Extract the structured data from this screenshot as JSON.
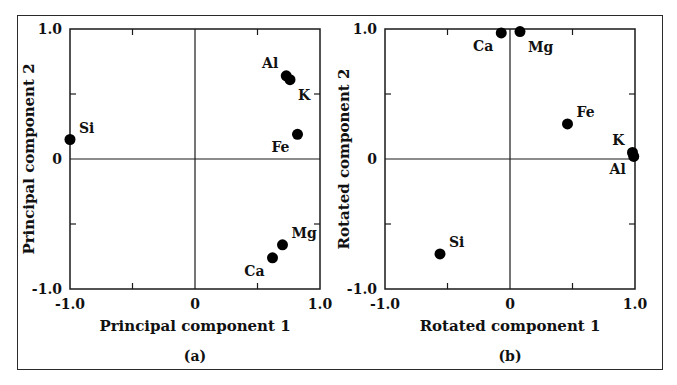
{
  "chart_data": [
    {
      "id": "a",
      "type": "scatter",
      "caption": "(a)",
      "title": "",
      "xlabel": "Principal component 1",
      "ylabel": "Principal component 2",
      "xlim": [
        -1.0,
        1.0
      ],
      "ylim": [
        -1.0,
        1.0
      ],
      "x_tick_labels": [
        "-1.0",
        "0",
        "1.0"
      ],
      "y_tick_labels": [
        "-1.0",
        "0",
        "1.0"
      ],
      "minor_ticks": [
        -0.5,
        0.5
      ],
      "grid": false,
      "zero_lines": true,
      "legend": null,
      "points": [
        {
          "label": "Al",
          "x": 0.73,
          "y": 0.64,
          "label_pos": "upper-left"
        },
        {
          "label": "K",
          "x": 0.76,
          "y": 0.61,
          "label_pos": "lower-right"
        },
        {
          "label": "Fe",
          "x": 0.82,
          "y": 0.19,
          "label_pos": "lower-left"
        },
        {
          "label": "Mg",
          "x": 0.7,
          "y": -0.66,
          "label_pos": "upper-right"
        },
        {
          "label": "Ca",
          "x": 0.62,
          "y": -0.76,
          "label_pos": "lower-left"
        },
        {
          "label": "Si",
          "x": -1.0,
          "y": 0.15,
          "label_pos": "upper-right"
        }
      ]
    },
    {
      "id": "b",
      "type": "scatter",
      "caption": "(b)",
      "title": "",
      "xlabel": "Rotated component 1",
      "ylabel": "Rotated component 2",
      "xlim": [
        -1.0,
        1.0
      ],
      "ylim": [
        -1.0,
        1.0
      ],
      "x_tick_labels": [
        "-1.0",
        "0",
        "1.0"
      ],
      "y_tick_labels": [
        "-1.0",
        "0",
        "1.0"
      ],
      "minor_ticks": [
        -0.5,
        0.5
      ],
      "grid": false,
      "zero_lines": true,
      "legend": null,
      "points": [
        {
          "label": "Ca",
          "x": -0.07,
          "y": 0.97,
          "label_pos": "lower-left"
        },
        {
          "label": "Mg",
          "x": 0.08,
          "y": 0.98,
          "label_pos": "lower-right"
        },
        {
          "label": "Fe",
          "x": 0.46,
          "y": 0.27,
          "label_pos": "upper-right"
        },
        {
          "label": "K",
          "x": 0.98,
          "y": 0.05,
          "label_pos": "upper-left"
        },
        {
          "label": "Al",
          "x": 0.99,
          "y": 0.02,
          "label_pos": "lower-left"
        },
        {
          "label": "Si",
          "x": -0.56,
          "y": -0.73,
          "label_pos": "upper-right"
        }
      ]
    }
  ],
  "style": {
    "line_color": "#1a1a1a",
    "marker_color": "#000000",
    "frame_color": "#2a2a2a",
    "background": "#ffffff"
  }
}
